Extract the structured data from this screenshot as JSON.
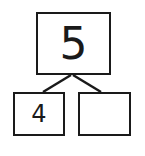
{
  "diagram": {
    "type": "number-bond",
    "whole": {
      "value": "5"
    },
    "parts": [
      {
        "value": "4"
      },
      {
        "value": ""
      }
    ],
    "colors": {
      "stroke": "#1a1a1a",
      "background": "#ffffff"
    }
  }
}
